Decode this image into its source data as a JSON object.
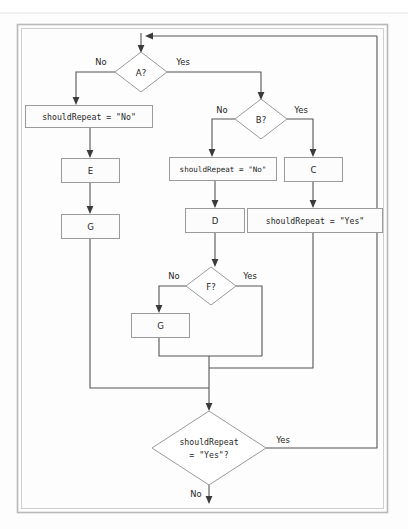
{
  "diagram": {
    "type": "flowchart",
    "canvas": {
      "width": 408,
      "height": 529
    },
    "frame": {
      "x": 17,
      "y": 24,
      "width": 371,
      "height": 489,
      "border_color": "#b9b9b9"
    },
    "colors": {
      "node_stroke": "#9a9a9a",
      "node_fill": "#fcfcfc",
      "line": "#555555",
      "text": "#1f1f1f",
      "frame": "#b9b9b9"
    },
    "nodes": [
      {
        "id": "a",
        "shape": "diamond",
        "label": "A?",
        "cx": 141,
        "cy": 72,
        "rx": 26,
        "ry": 20
      },
      {
        "id": "sr_no_left",
        "shape": "rect",
        "label": "shouldRepeat = \"No\"",
        "x": 25,
        "y": 105,
        "width": 128,
        "height": 23,
        "mono": true
      },
      {
        "id": "e",
        "shape": "rect",
        "label": "E",
        "x": 61,
        "y": 158,
        "width": 59,
        "height": 25
      },
      {
        "id": "g_left",
        "shape": "rect",
        "label": "G",
        "x": 61,
        "y": 214,
        "width": 59,
        "height": 25
      },
      {
        "id": "b",
        "shape": "diamond",
        "label": "B?",
        "cx": 261,
        "cy": 119,
        "rx": 26,
        "ry": 20
      },
      {
        "id": "sr_no_mid",
        "shape": "rect",
        "label": "shouldRepeat = \"No\"",
        "x": 169,
        "y": 157,
        "width": 108,
        "height": 24,
        "mono": true
      },
      {
        "id": "c",
        "shape": "rect",
        "label": "C",
        "x": 284,
        "y": 157,
        "width": 59,
        "height": 25
      },
      {
        "id": "d",
        "shape": "rect",
        "label": "D",
        "x": 185,
        "y": 208,
        "width": 60,
        "height": 25
      },
      {
        "id": "sr_yes",
        "shape": "rect",
        "label": "shouldRepeat = \"Yes\"",
        "x": 247,
        "y": 208,
        "width": 136,
        "height": 25,
        "mono": true
      },
      {
        "id": "f",
        "shape": "diamond",
        "label": "F?",
        "cx": 211,
        "cy": 286,
        "rx": 25,
        "ry": 19
      },
      {
        "id": "g_mid",
        "shape": "rect",
        "label": "G",
        "x": 131,
        "y": 313,
        "width": 59,
        "height": 25
      },
      {
        "id": "loop_check",
        "shape": "diamond",
        "label_line1": "shouldRepeat",
        "label_line2": "= \"Yes\"?",
        "cx": 209,
        "cy": 448,
        "rx": 57,
        "ry": 37,
        "mono": true
      }
    ],
    "edge_labels": [
      {
        "id": "a-no",
        "text": "No",
        "x": 101,
        "y": 62
      },
      {
        "id": "a-yes",
        "text": "Yes",
        "x": 183,
        "y": 62
      },
      {
        "id": "b-no",
        "text": "No",
        "x": 222,
        "y": 110
      },
      {
        "id": "b-yes",
        "text": "Yes",
        "x": 301,
        "y": 110
      },
      {
        "id": "f-no",
        "text": "No",
        "x": 174,
        "y": 276
      },
      {
        "id": "f-yes",
        "text": "Yes",
        "x": 250,
        "y": 276
      },
      {
        "id": "loop-yes",
        "text": "Yes",
        "x": 283,
        "y": 440
      },
      {
        "id": "loop-no",
        "text": "No",
        "x": 196,
        "y": 494
      }
    ],
    "notes": {
      "entry": "Top entry arrow into A?",
      "loop_back": "Yes branch of shouldRepeat = \"Yes\"? returns to the top entry point",
      "exit": "No branch of shouldRepeat = \"Yes\"? exits at the bottom"
    }
  }
}
